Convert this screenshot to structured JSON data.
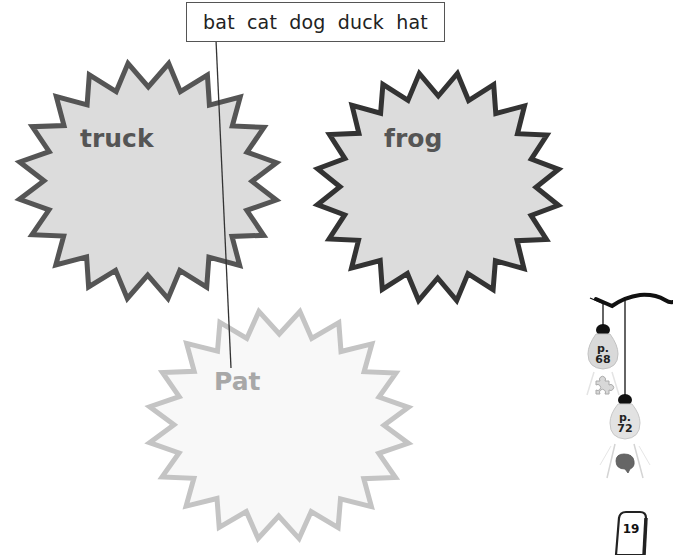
{
  "word_bank": {
    "words": [
      "bat",
      "cat",
      "dog",
      "duck",
      "hat"
    ]
  },
  "starbursts": [
    {
      "label": "truck",
      "style": "dark",
      "fill": "#dcdcdc",
      "stroke": "#555555"
    },
    {
      "label": "frog",
      "style": "dark",
      "fill": "#dcdcdc",
      "stroke": "#333333"
    },
    {
      "label": "Pat",
      "style": "light",
      "fill": "#f8f8f8",
      "stroke": "#c4c4c4"
    }
  ],
  "connector_line": {
    "from_word": "bat",
    "to_label": "Pat"
  },
  "reference_bulbs": [
    {
      "prefix": "p.",
      "page": "68",
      "icon": "puzzle-icon"
    },
    {
      "prefix": "p.",
      "page": "72",
      "icon": "brain-icon"
    }
  ],
  "page_number": "19",
  "colors": {
    "dark_text": "#555555",
    "light_text": "#a8a8a8",
    "box_border": "#555555"
  }
}
